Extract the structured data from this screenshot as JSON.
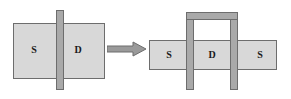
{
  "figure": {
    "colors": {
      "slab_fill": "#d8d8d8",
      "bar_fill": "#a9a9a9",
      "outline": "#6d6d6d",
      "arrow": "#8a8a8a",
      "background": "#ffffff",
      "text": "#1a1a1a"
    }
  },
  "left_figure": {
    "name": "planar-device",
    "slab": {
      "label": "channel-slab"
    },
    "gate": {
      "label": "vertical-gate-bar"
    },
    "labels": {
      "source": "S",
      "drain": "D"
    }
  },
  "arrow": {
    "label": "transformation-arrow",
    "direction": "right"
  },
  "right_figure": {
    "name": "finfet-device",
    "slab": {
      "label": "channel-slab"
    },
    "gate": {
      "label": "wrap-around-gate-staple"
    },
    "labels": {
      "source_left": "S",
      "drain": "D",
      "source_right": "S"
    }
  }
}
